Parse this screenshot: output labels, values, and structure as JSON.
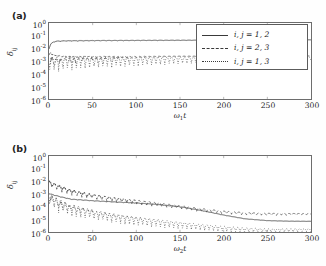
{
  "figure": {
    "background": "#fefefe",
    "line_color": "#3a3a3a"
  },
  "panels": [
    {
      "tag": "(a)",
      "xaxis_title_main": "ω",
      "xaxis_title_sub": "1",
      "xaxis_title_tail": "t",
      "yaxis_title_main": "δ",
      "yaxis_title_sub": "ij"
    },
    {
      "tag": "(b)",
      "xaxis_title_main": "ω",
      "xaxis_title_sub": "2",
      "xaxis_title_tail": "t",
      "yaxis_title_main": "δ",
      "yaxis_title_sub": "ij"
    }
  ],
  "ticks": {
    "x": [
      "0",
      "50",
      "100",
      "150",
      "200",
      "250",
      "300"
    ],
    "y_mantissa": "10",
    "y_exponents": [
      "0",
      "-1",
      "-2",
      "-3",
      "-4",
      "-5",
      "-6"
    ]
  },
  "legend": {
    "entries": [
      {
        "style": "solid",
        "label": "i, j = 1, 2"
      },
      {
        "style": "dashed",
        "label": "i, j = 2, 3"
      },
      {
        "style": "dotted",
        "label": "i, j = 1, 3"
      }
    ]
  },
  "chart_data": {
    "type": "line",
    "title": "",
    "subplots": [
      {
        "tag": "(a)",
        "xlabel": "ω₁t",
        "ylabel": "δ_ij",
        "xlim": [
          0,
          300
        ],
        "ylim": [
          1e-06,
          1
        ],
        "yscale": "log",
        "xscale": "linear",
        "grid": false,
        "legend_position": "upper-right-inside",
        "series": [
          {
            "name": "i, j = 1, 2",
            "style": "solid",
            "description": "Rises sharply from ~1e-2 at t=0 to a plateau near 4e-2, then stays essentially flat with a very slow rise to ~5e-2 by t=300.",
            "x": [
              0,
              2,
              5,
              10,
              20,
              40,
              60,
              100,
              150,
              200,
              250,
              300
            ],
            "y": [
              0.01,
              0.022,
              0.033,
              0.038,
              0.04,
              0.041,
              0.042,
              0.043,
              0.044,
              0.045,
              0.046,
              0.047
            ],
            "oscillation_amplitude_decades": 0.05
          },
          {
            "name": "i, j = 2, 3",
            "style": "dashed",
            "description": "Noisy band near 2e-3 to 4e-3 at small t, settling into a nearly flat line at ~2.4e-3 with small ripples.",
            "x": [
              0,
              2,
              5,
              10,
              20,
              40,
              60,
              100,
              150,
              200,
              250,
              300
            ],
            "y": [
              0.003,
              0.005,
              0.003,
              0.0026,
              0.0024,
              0.0023,
              0.0023,
              0.0023,
              0.0024,
              0.0024,
              0.0025,
              0.0025
            ],
            "oscillation_amplitude_decades": 0.12
          },
          {
            "name": "i, j = 1, 3",
            "style": "dotted",
            "description": "Strongly oscillatory: envelope top near 2e-3 with repeated deep downward spikes reaching 1e-4 early (t<40) and ~3e-4 later; spike density increases with t.",
            "x": [
              0,
              2,
              5,
              10,
              20,
              40,
              60,
              100,
              150,
              200,
              250,
              300
            ],
            "y": [
              0.0012,
              0.0018,
              0.0016,
              0.0015,
              0.0016,
              0.0017,
              0.0018,
              0.0019,
              0.002,
              0.002,
              0.0021,
              0.0021
            ],
            "spike_floor": [
              0.0001,
              0.00012,
              0.00015,
              0.0002,
              0.00025,
              0.0003,
              0.00035,
              0.0004
            ],
            "oscillation_amplitude_decades": 1.0
          }
        ]
      },
      {
        "tag": "(b)",
        "xlabel": "ω₂t",
        "ylabel": "δ_ij",
        "xlim": [
          0,
          300
        ],
        "ylim": [
          1e-06,
          1
        ],
        "yscale": "log",
        "xscale": "linear",
        "grid": false,
        "legend_position": "upper-right-inside",
        "series": [
          {
            "name": "i, j = 1, 2",
            "style": "solid",
            "description": "Starts near 1.1e-3, decays smoothly through 3e-4 at t=50 and 2e-4 at t=100, steepening near t=150-230 and levelling off at ~7e-6 beyond t=250.",
            "x": [
              0,
              10,
              25,
              50,
              75,
              100,
              125,
              150,
              175,
              200,
              225,
              250,
              275,
              300
            ],
            "y": [
              0.0011,
              0.0007,
              0.0004,
              0.0003,
              0.00024,
              0.0002,
              0.00015,
              0.0001,
              5e-05,
              2.2e-05,
              1.1e-05,
              8e-06,
              7.2e-06,
              7e-06
            ],
            "oscillation_amplitude_decades": 0.05
          },
          {
            "name": "i, j = 2, 3",
            "style": "dashed",
            "description": "Highest curve: noisy band starting at ~1e-2 near t=0, decaying roughly log-linearly to ~1e-4 at t=150 and flattening to ~3e-5 after t=230.",
            "x": [
              0,
              10,
              25,
              50,
              75,
              100,
              125,
              150,
              175,
              200,
              225,
              250,
              275,
              300
            ],
            "y": [
              0.01,
              0.005,
              0.002,
              0.0009,
              0.0005,
              0.00032,
              0.0002,
              0.00012,
              7e-05,
              4.5e-05,
              3.4e-05,
              3e-05,
              2.9e-05,
              2.9e-05
            ],
            "oscillation_amplitude_decades": 0.45
          },
          {
            "name": "i, j = 1, 3",
            "style": "dotted",
            "description": "Lowest curve: oscillatory band from ~1e-3 near t=0, decaying steadily past 1e-4 at t=60 and 1e-5 at t=140, flattening near 1.8e-6 beyond t=230.",
            "x": [
              0,
              10,
              25,
              50,
              75,
              100,
              125,
              150,
              175,
              200,
              225,
              250,
              275,
              300
            ],
            "y": [
              0.0009,
              0.0003,
              0.00012,
              5e-05,
              2.5e-05,
              1.4e-05,
              9e-06,
              6e-06,
              4e-06,
              2.8e-06,
              2.1e-06,
              1.8e-06,
              1.8e-06,
              1.8e-06
            ],
            "oscillation_amplitude_decades": 0.9
          }
        ]
      }
    ]
  }
}
